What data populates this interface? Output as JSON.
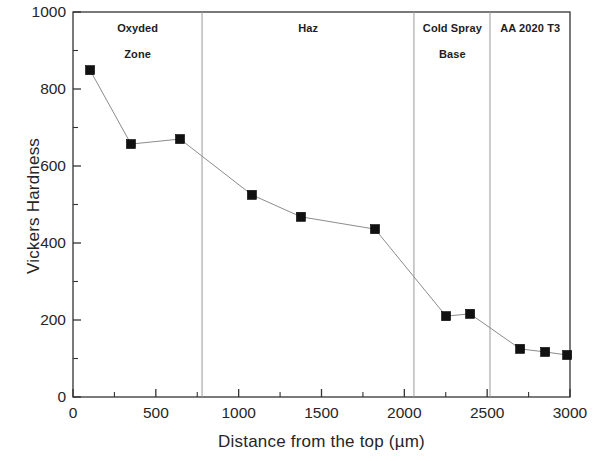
{
  "chart_data": {
    "type": "line",
    "title": "",
    "xlabel": "Distance from the top (µm)",
    "ylabel": "Vickers Hardness",
    "xlim": [
      0,
      3000
    ],
    "ylim": [
      0,
      1000
    ],
    "xticks": [
      0,
      500,
      1000,
      1500,
      2000,
      2500,
      3000
    ],
    "xtick_labels": [
      "0",
      "500",
      "1000",
      "1500",
      "2000",
      "2500",
      "3000"
    ],
    "yticks": [
      0,
      200,
      400,
      600,
      800,
      1000
    ],
    "ytick_labels": [
      "0",
      "200",
      "400",
      "600",
      "800",
      "1000"
    ],
    "y_minor_ticks": [
      100,
      300,
      500,
      700,
      900
    ],
    "x_minor_ticks": [
      250,
      750,
      1250,
      1750,
      2250,
      2750
    ],
    "grid": false,
    "legend": null,
    "marker": "filled-square",
    "marker_color": "#111111",
    "line_color": "#8c8c8c",
    "line_style": "solid-thin",
    "series": [
      {
        "name": "Vickers Hardness profile",
        "x": [
          103,
          350,
          646,
          1080,
          1376,
          1823,
          2252,
          2397,
          2699,
          2850,
          2983
        ],
        "y": [
          849,
          657,
          670,
          525,
          468,
          436,
          210,
          216,
          125,
          117,
          109
        ]
      }
    ],
    "zone_dividers": [
      779,
      2058,
      2517
    ],
    "zones": [
      {
        "lines": [
          "Oxyded",
          "Zone"
        ],
        "center_x": 390
      },
      {
        "lines": [
          "Haz"
        ],
        "center_x": 1420
      },
      {
        "lines": [
          "Cold Spray",
          "Base"
        ],
        "center_x": 2290
      },
      {
        "lines": [
          "AA 2020 T3"
        ],
        "center_x": 2760
      }
    ]
  }
}
